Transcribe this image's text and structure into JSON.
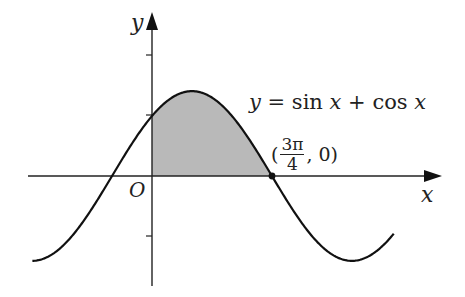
{
  "figure": {
    "y_axis_label": "y",
    "x_axis_label": "x",
    "origin_label": "O",
    "equation": {
      "lhs": "y",
      "eq": "=",
      "f1": "sin",
      "v1": "x",
      "plus": "+",
      "f2": "cos",
      "v2": "x"
    },
    "point": {
      "open": "(",
      "num": "3π",
      "den": "4",
      "rest": ", 0)"
    },
    "colors": {
      "curve": "#111111",
      "shade": "#b9b9b9",
      "axis": "#222222"
    }
  },
  "chart_data": {
    "type": "line",
    "title": "y = sin x + cos x",
    "xlabel": "x",
    "ylabel": "y",
    "function": "sin(x) + cos(x)",
    "x_range": [
      -2.35,
      4.75
    ],
    "y_ticks": [
      2,
      1,
      -1
    ],
    "marked_point": {
      "label": "(3π/4, 0)",
      "x": 2.356,
      "y": 0
    },
    "shaded_region": {
      "from_x": 0,
      "to_x": 2.356,
      "between": "curve and x-axis"
    },
    "sample_points": [
      {
        "x": -2.356,
        "y": -1.414
      },
      {
        "x": -0.785,
        "y": 0
      },
      {
        "x": 0,
        "y": 1
      },
      {
        "x": 0.785,
        "y": 1.414
      },
      {
        "x": 2.356,
        "y": 0
      },
      {
        "x": 3.927,
        "y": -1.414
      },
      {
        "x": 4.712,
        "y": -1
      }
    ],
    "grid": false
  }
}
